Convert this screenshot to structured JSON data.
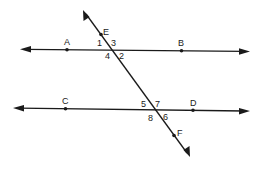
{
  "diagram": {
    "lines": [
      {
        "name": "AB",
        "points": [
          "A",
          "B"
        ]
      },
      {
        "name": "CD",
        "points": [
          "C",
          "D"
        ]
      },
      {
        "name": "EF",
        "points": [
          "E",
          "F"
        ],
        "role": "transversal"
      }
    ],
    "points": {
      "A": "A",
      "B": "B",
      "C": "C",
      "D": "D",
      "E": "E",
      "F": "F"
    },
    "angles": {
      "a1": "1",
      "a2": "2",
      "a3": "3",
      "a4": "4",
      "a5": "5",
      "a6": "6",
      "a7": "7",
      "a8": "8"
    },
    "colors": {
      "stroke": "#1a1a1a",
      "background": "#ffffff"
    }
  }
}
